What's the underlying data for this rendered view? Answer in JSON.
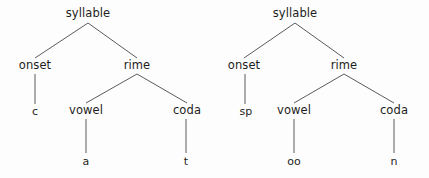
{
  "figure": {
    "background_color": "#fdfdfe",
    "line_color": "#5b5b5f",
    "text_color": "#1d1d20"
  },
  "trees": [
    {
      "id": "tree-cat",
      "word": "cat",
      "nodes": [
        {
          "id": "syllable",
          "label": "syllable",
          "kind": "category",
          "level": 0,
          "x": 88,
          "y": 14
        },
        {
          "id": "onset",
          "label": "onset",
          "kind": "category",
          "level": 1,
          "x": 35,
          "y": 66
        },
        {
          "id": "rime",
          "label": "rime",
          "kind": "category",
          "level": 1,
          "x": 137,
          "y": 66
        },
        {
          "id": "onset-seg",
          "label": "c",
          "kind": "segment",
          "level": 2,
          "x": 35,
          "y": 111
        },
        {
          "id": "vowel",
          "label": "vowel",
          "kind": "category",
          "level": 2,
          "x": 86,
          "y": 111
        },
        {
          "id": "coda",
          "label": "coda",
          "kind": "category",
          "level": 2,
          "x": 187,
          "y": 111
        },
        {
          "id": "vowel-seg",
          "label": "a",
          "kind": "segment",
          "level": 3,
          "x": 86,
          "y": 161
        },
        {
          "id": "coda-seg",
          "label": "t",
          "kind": "segment",
          "level": 3,
          "x": 186,
          "y": 161
        }
      ],
      "edges": [
        {
          "from": "syllable",
          "to": "onset",
          "x1": 88,
          "y1": 23,
          "x2": 35,
          "y2": 58
        },
        {
          "from": "syllable",
          "to": "rime",
          "x1": 88,
          "y1": 23,
          "x2": 137,
          "y2": 58
        },
        {
          "from": "onset",
          "to": "onset-seg",
          "x1": 35,
          "y1": 74,
          "x2": 35,
          "y2": 104
        },
        {
          "from": "rime",
          "to": "vowel",
          "x1": 137,
          "y1": 74,
          "x2": 86,
          "y2": 103
        },
        {
          "from": "rime",
          "to": "coda",
          "x1": 137,
          "y1": 74,
          "x2": 187,
          "y2": 103
        },
        {
          "from": "vowel",
          "to": "vowel-seg",
          "x1": 86,
          "y1": 119,
          "x2": 86,
          "y2": 153
        },
        {
          "from": "coda",
          "to": "coda-seg",
          "x1": 186,
          "y1": 119,
          "x2": 186,
          "y2": 153
        }
      ]
    },
    {
      "id": "tree-spoon",
      "word": "spoon",
      "nodes": [
        {
          "id": "syllable",
          "label": "syllable",
          "kind": "category",
          "level": 0,
          "x": 295,
          "y": 14
        },
        {
          "id": "onset",
          "label": "onset",
          "kind": "category",
          "level": 1,
          "x": 244,
          "y": 66
        },
        {
          "id": "rime",
          "label": "rime",
          "kind": "category",
          "level": 1,
          "x": 344,
          "y": 66
        },
        {
          "id": "onset-seg",
          "label": "sp",
          "kind": "segment",
          "level": 2,
          "x": 246,
          "y": 111
        },
        {
          "id": "vowel",
          "label": "vowel",
          "kind": "category",
          "level": 2,
          "x": 294,
          "y": 111
        },
        {
          "id": "coda",
          "label": "coda",
          "kind": "category",
          "level": 2,
          "x": 394,
          "y": 111
        },
        {
          "id": "vowel-seg",
          "label": "oo",
          "kind": "segment",
          "level": 3,
          "x": 294,
          "y": 161
        },
        {
          "id": "coda-seg",
          "label": "n",
          "kind": "segment",
          "level": 3,
          "x": 394,
          "y": 161
        }
      ],
      "edges": [
        {
          "from": "syllable",
          "to": "onset",
          "x1": 295,
          "y1": 23,
          "x2": 244,
          "y2": 58
        },
        {
          "from": "syllable",
          "to": "rime",
          "x1": 295,
          "y1": 23,
          "x2": 344,
          "y2": 58
        },
        {
          "from": "onset",
          "to": "onset-seg",
          "x1": 245,
          "y1": 74,
          "x2": 245,
          "y2": 104
        },
        {
          "from": "rime",
          "to": "vowel",
          "x1": 344,
          "y1": 74,
          "x2": 294,
          "y2": 103
        },
        {
          "from": "rime",
          "to": "coda",
          "x1": 344,
          "y1": 74,
          "x2": 394,
          "y2": 103
        },
        {
          "from": "vowel",
          "to": "vowel-seg",
          "x1": 294,
          "y1": 119,
          "x2": 294,
          "y2": 153
        },
        {
          "from": "coda",
          "to": "coda-seg",
          "x1": 394,
          "y1": 119,
          "x2": 394,
          "y2": 153
        }
      ]
    }
  ]
}
